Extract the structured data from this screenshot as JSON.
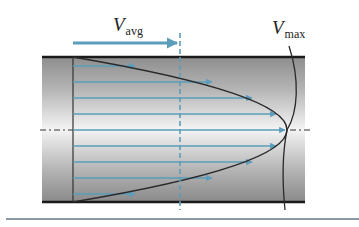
{
  "figure": {
    "type": "fully developed laminar pipe flow velocity profile",
    "labels": {
      "vavg": {
        "main": "V",
        "sub": "avg"
      },
      "vmax": {
        "main": "V",
        "sub": "max"
      }
    },
    "colors": {
      "arrow": "#5b9dbb",
      "wall": "#1a1a1a",
      "profile_curve": "#2a2a2a",
      "pipe_gradient_edge": "#8e8e8e",
      "pipe_gradient_center": "#f4f4f4",
      "bottom_rule": "#8a9aa4"
    },
    "profile": {
      "shape": "parabolic",
      "arrow_count": 9,
      "description": "Velocity arrows increase from zero at walls to maximum at centerline"
    }
  }
}
